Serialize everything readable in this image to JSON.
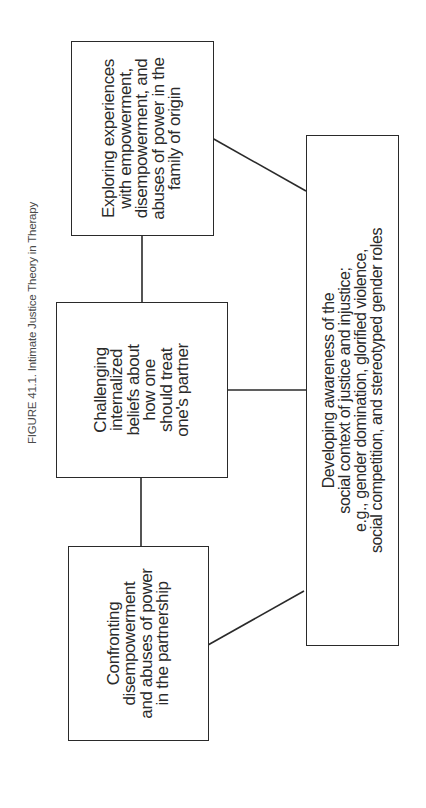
{
  "figure": {
    "caption": "FIGURE 41.1. Intimate Justice Theory in Therapy",
    "orientation": "rotated 90° counter-clockwise"
  },
  "nodes": {
    "family_origin": {
      "text": "Exploring experiences\nwith empowerment,\ndisempowerment, and\nabuses of power in the\nfamily of origin"
    },
    "internalized_beliefs": {
      "text": "Challenging\ninternalized\nbeliefs about\nhow one\nshould treat\none's partner"
    },
    "partnership": {
      "text": "Confronting\ndisempowerment\nand abuses of power\nin the partnership"
    },
    "social_context": {
      "text": "Developing awareness of the\nsocial context of justice and injustice;\ne.g., gender domination, glorified violence,\nsocial competition, and stereotyped gender roles"
    }
  },
  "edges": [
    {
      "from": "family_origin",
      "to": "internalized_beliefs",
      "style": "straight"
    },
    {
      "from": "internalized_beliefs",
      "to": "partnership",
      "style": "straight"
    },
    {
      "from": "internalized_beliefs",
      "to": "social_context",
      "style": "straight"
    },
    {
      "from": "family_origin",
      "to": "social_context",
      "style": "diagonal"
    },
    {
      "from": "partnership",
      "to": "social_context",
      "style": "diagonal"
    }
  ],
  "colors": {
    "line": "#2a2a2a",
    "caption": "#4a4a4a",
    "background": "#ffffff"
  }
}
